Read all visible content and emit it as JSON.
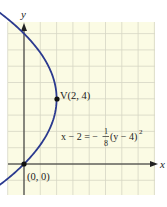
{
  "figure": {
    "background": "#fbfbe4",
    "grid_color": "#d6d6c4",
    "axis_color": "#222222",
    "curve_color": "#2b3a8f",
    "axes": {
      "x_label": "x",
      "y_label": "y"
    },
    "points": [
      {
        "label": "V(2, 4)",
        "x": 2,
        "y": 4
      },
      {
        "label": "(0, 0)",
        "x": 0,
        "y": 0
      }
    ],
    "equation": {
      "lhs": "x − 2 = −",
      "frac_num": "1",
      "frac_den": "8",
      "rhs": "(y − 4)",
      "exponent": "2"
    }
  },
  "chart_data": {
    "type": "line",
    "title": "",
    "xlabel": "x",
    "ylabel": "y",
    "equation": "x - 2 = -(1/8)(y - 4)^2",
    "vertex": [
      2,
      4
    ],
    "labeled_points": [
      [
        2,
        4
      ],
      [
        0,
        0
      ]
    ],
    "xlim": [
      -1,
      8
    ],
    "ylim": [
      -2,
      9
    ],
    "grid": true,
    "series": [
      {
        "name": "parabola",
        "x": [
          -1.92,
          -0.88,
          0,
          0.88,
          1.5,
          1.88,
          2,
          1.88,
          1.5,
          0.88,
          0,
          -0.88,
          -1.92
        ],
        "y": [
          -1.6,
          -0.2,
          0,
          1.0,
          2.0,
          3.0,
          4,
          5.0,
          6.0,
          7.0,
          8,
          8.8,
          9.6
        ]
      }
    ]
  }
}
